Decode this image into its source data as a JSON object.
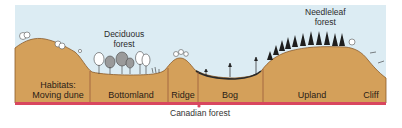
{
  "diagram": {
    "title": "Canadian forest",
    "colors": {
      "sky": "#dcecf3",
      "ground": "#d4a05a",
      "ground_edge": "#8a5a2a",
      "baseline": "#d9475f",
      "divider": "#9a5a3a",
      "bog_surface": "#2a2a2a"
    },
    "vegetation_labels": {
      "deciduous": [
        "Deciduous",
        "forest"
      ],
      "needleleaf": [
        "Needleleaf",
        "forest"
      ]
    },
    "habitats": [
      {
        "id": "moving-dune",
        "lines": [
          "Habitats:",
          "Moving dune"
        ]
      },
      {
        "id": "bottomland",
        "lines": [
          "Bottomland"
        ]
      },
      {
        "id": "ridge",
        "lines": [
          "Ridge"
        ]
      },
      {
        "id": "bog",
        "lines": [
          "Bog"
        ]
      },
      {
        "id": "upland",
        "lines": [
          "Upland"
        ]
      },
      {
        "id": "cliff",
        "lines": [
          "Cliff"
        ]
      }
    ]
  }
}
